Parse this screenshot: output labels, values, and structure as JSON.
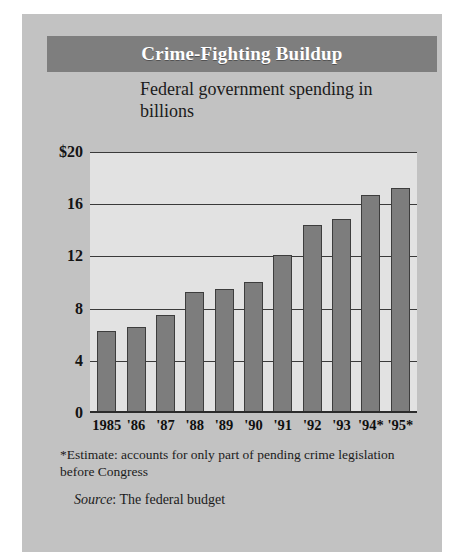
{
  "figure": {
    "title": "Crime-Fighting Buildup",
    "subtitle": "Federal government spending in billions",
    "footnote": "*Estimate: accounts for only part of pending crime legislation before Congress",
    "source_label": "Source",
    "source_value": ": The federal budget",
    "colors": {
      "card_background": "#c2c2c2",
      "title_band": "#7e7e7e",
      "title_text": "#ffffff",
      "plot_background": "#e2e2e2",
      "bar_fill": "#7d7d7d",
      "bar_stroke": "#3d3d3d",
      "gridline": "#3a3a3a",
      "text": "#1b1b1b"
    }
  },
  "chart_data": {
    "type": "bar",
    "title": "Crime-Fighting Buildup",
    "subtitle": "Federal government spending in billions",
    "xlabel": "",
    "ylabel": "",
    "ylim": [
      0,
      20
    ],
    "yticks": [
      0,
      4,
      8,
      12,
      16,
      20
    ],
    "ytick_labels": [
      "0",
      "4",
      "8",
      "12",
      "16",
      "$20"
    ],
    "grid": true,
    "legend": "none",
    "categories": [
      "1985",
      "'86",
      "'87",
      "'88",
      "'89",
      "'90",
      "'91",
      "'92",
      "'93",
      "'94*",
      "'95*"
    ],
    "values": [
      6.2,
      6.5,
      7.4,
      9.2,
      9.4,
      10.0,
      12.0,
      14.3,
      14.8,
      16.6,
      17.2
    ],
    "units": "billions of dollars",
    "annotations": [
      "*Estimate: accounts for only part of pending crime legislation before Congress",
      "Source: The federal budget"
    ]
  }
}
